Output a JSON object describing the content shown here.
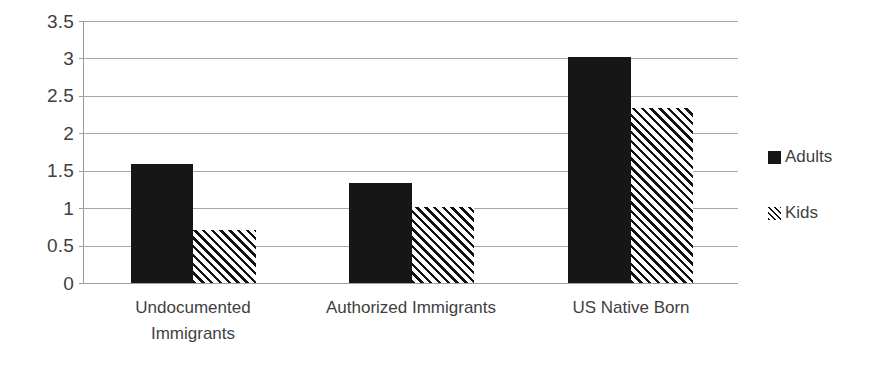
{
  "chart_data": {
    "type": "bar",
    "title": "",
    "subtitle": "",
    "xlabel": "",
    "ylabel": "",
    "categories": [
      "Undocumented Immigrants",
      "Authorized Immigrants",
      "US Native Born"
    ],
    "series": [
      {
        "name": "Adults",
        "values": [
          1.59,
          1.33,
          3.02
        ],
        "fill": "solid-black",
        "color": "#161616"
      },
      {
        "name": "Kids",
        "values": [
          0.71,
          1.01,
          2.34
        ],
        "fill": "diagonal-hatch",
        "color": "#121212"
      }
    ],
    "ylim": [
      0,
      3.5
    ],
    "y_ticks": [
      "0",
      "0.5",
      "1",
      "1.5",
      "2",
      "2.5",
      "3",
      "3.5"
    ],
    "y_tick_values": [
      0,
      0.5,
      1,
      1.5,
      2,
      2.5,
      3,
      3.5
    ],
    "grid": "horizontal",
    "legend_position": "right",
    "legend": [
      {
        "label": "Adults",
        "swatch": "solid-square-icon"
      },
      {
        "label": "Kids",
        "swatch": "hatched-square-icon"
      }
    ],
    "background": "#ffffff",
    "gridline_color": "#a8a8a8",
    "axis_color": "#9a9a9a",
    "text_color": "#3f3f3f"
  }
}
